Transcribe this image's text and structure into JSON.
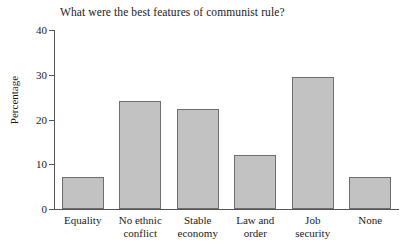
{
  "chart_data": {
    "type": "bar",
    "title": "What were the best features of communist rule?",
    "xlabel": "",
    "ylabel": "Percentage",
    "categories": [
      "Equality",
      "No ethnic\nconflict",
      "Stable\neconomy",
      "Law and\norder",
      "Job\nsecurity",
      "None"
    ],
    "values": [
      7.1,
      24.2,
      22.4,
      12.1,
      29.4,
      7.2
    ],
    "ylim": [
      0,
      40
    ],
    "yticks": [
      0,
      10,
      20,
      30,
      40
    ],
    "ytick_labels": [
      "0",
      "10",
      "20",
      "30",
      "40"
    ],
    "grid": false,
    "legend": null,
    "bar_fill_color": "#c2c2c2",
    "bar_edge_color": "#6e6e6e",
    "background_color": "#ffffff",
    "axis_color": "#555555"
  }
}
